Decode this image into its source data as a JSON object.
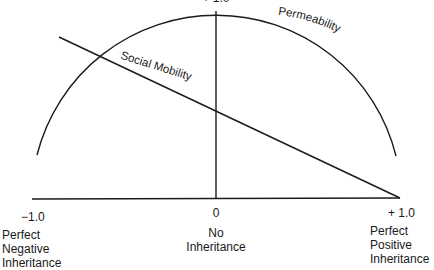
{
  "diagram": {
    "top_tick": "+ 1.0",
    "curve_label": "Permeability",
    "line_label": "Social Mobility",
    "axis": {
      "left": {
        "tick": "−1.0",
        "label_lines": [
          "Perfect",
          "Negative",
          "Inheritance"
        ]
      },
      "center": {
        "tick": "0",
        "label_lines": [
          "No",
          "Inheritance"
        ]
      },
      "right": {
        "tick": "+ 1.0",
        "label_lines": [
          "Perfect",
          "Positive",
          "Inheritance"
        ]
      }
    },
    "colors": {
      "stroke": "#1a1a1a",
      "background": "#ffffff"
    }
  }
}
